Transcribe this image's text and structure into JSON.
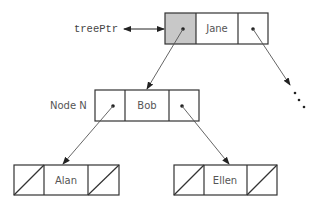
{
  "diagram": {
    "type": "binary-tree-linked-representation",
    "pointer": {
      "label": "treePtr"
    },
    "nodes": [
      {
        "id": "jane",
        "label": "Jane",
        "left": "bob",
        "right": "more"
      },
      {
        "id": "bob",
        "label": "Bob",
        "caption": "Node N",
        "left": "alan",
        "right": "ellen"
      },
      {
        "id": "alan",
        "label": "Alan",
        "left": null,
        "right": null
      },
      {
        "id": "ellen",
        "label": "Ellen",
        "left": null,
        "right": null
      }
    ],
    "colors": {
      "stroke": "#333333",
      "highlight_cell": "#c8c8c8",
      "text": "#555555"
    }
  }
}
